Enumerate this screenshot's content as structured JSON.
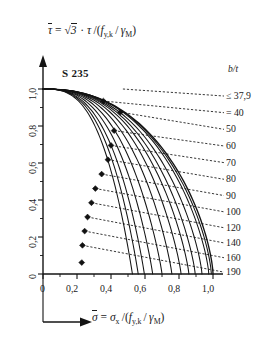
{
  "figure": {
    "steel_grade": "S 235",
    "bt_header": "b/t",
    "y_axis_equation_parts": {
      "tau_bar": "τ",
      "equals": "=",
      "sqrt3": "3",
      "dot": "·",
      "tau": "τ",
      "slash_open": "/(",
      "f": "f",
      "f_sub": "y,k",
      "inner_slash": "/",
      "gamma": "γ",
      "gamma_sub": "M",
      "close": ")"
    },
    "x_axis_equation_parts": {
      "sigma_bar": "σ",
      "equals": "=",
      "sigma": "σ",
      "sigma_sub": "x",
      "slash_open": "/(",
      "f": "f",
      "f_sub": "y,k",
      "inner_slash": "/",
      "gamma": "γ",
      "gamma_sub": "M",
      "close": ")"
    }
  },
  "chart_data": {
    "type": "line",
    "title": "",
    "subtitle": "",
    "xlabel": "σ̄ = σx /(fy,k / γM)",
    "ylabel": "τ̄ = √3 · τ /(fy,k / γM)",
    "xlim": [
      0,
      1.0
    ],
    "ylim": [
      0,
      1.0
    ],
    "grid": false,
    "legend_position": "right",
    "x_ticks": [
      0,
      0.2,
      0.4,
      0.6,
      0.8,
      1.0
    ],
    "x_tick_labels": [
      "0",
      "0,2",
      "0,4",
      "0,6",
      "0,8",
      "1,0"
    ],
    "y_ticks": [
      0,
      0.2,
      0.4,
      0.6,
      0.8,
      1.0
    ],
    "y_tick_labels": [
      "0",
      "0,2",
      "0,4",
      "0,6",
      "0,8",
      "1,0"
    ],
    "x_minor_ticks": [
      0.1,
      0.3,
      0.5,
      0.7,
      0.9
    ],
    "y_minor_ticks": [
      0.1,
      0.3,
      0.5,
      0.7,
      0.9
    ],
    "annotation": "S 235",
    "series_label_header": "b/t",
    "series": [
      {
        "name": "≤ 37,9",
        "marker": null,
        "x": [
          0.0,
          0.12,
          0.24,
          0.36,
          0.48,
          0.6,
          0.72,
          0.84,
          0.92,
          0.965,
          0.985,
          1.0
        ],
        "y": [
          1.0,
          0.999,
          0.995,
          0.988,
          0.975,
          0.952,
          0.912,
          0.836,
          0.735,
          0.62,
          0.45,
          0.0
        ]
      },
      {
        "name": "= 40",
        "marker": {
          "x": 0.355,
          "y": 0.935
        },
        "x": [
          0.0,
          0.12,
          0.24,
          0.355,
          0.48,
          0.6,
          0.72,
          0.84,
          0.91,
          0.95,
          0.975,
          0.99
        ],
        "y": [
          1.0,
          0.995,
          0.978,
          0.935,
          0.952,
          0.928,
          0.888,
          0.812,
          0.712,
          0.6,
          0.43,
          0.0
        ]
      },
      {
        "name": "50",
        "marker": {
          "x": 0.455,
          "y": 0.875
        },
        "x": [
          0.0,
          0.12,
          0.26,
          0.38,
          0.455,
          0.58,
          0.7,
          0.8,
          0.875,
          0.925,
          0.955,
          0.975
        ],
        "y": [
          1.0,
          0.985,
          0.948,
          0.905,
          0.875,
          0.838,
          0.782,
          0.706,
          0.608,
          0.49,
          0.33,
          0.0
        ]
      },
      {
        "name": "60",
        "marker": {
          "x": 0.418,
          "y": 0.775
        },
        "x": [
          0.0,
          0.1,
          0.22,
          0.33,
          0.418,
          0.53,
          0.64,
          0.74,
          0.82,
          0.878,
          0.912,
          0.935
        ],
        "y": [
          1.0,
          0.972,
          0.918,
          0.848,
          0.775,
          0.735,
          0.682,
          0.612,
          0.522,
          0.415,
          0.27,
          0.0
        ]
      },
      {
        "name": "70",
        "marker": {
          "x": 0.4,
          "y": 0.695
        },
        "x": [
          0.0,
          0.1,
          0.21,
          0.31,
          0.4,
          0.5,
          0.6,
          0.69,
          0.77,
          0.828,
          0.868,
          0.895
        ],
        "y": [
          1.0,
          0.958,
          0.886,
          0.8,
          0.695,
          0.66,
          0.608,
          0.542,
          0.458,
          0.358,
          0.23,
          0.0
        ]
      },
      {
        "name": "80",
        "marker": {
          "x": 0.382,
          "y": 0.618
        },
        "x": [
          0.0,
          0.09,
          0.19,
          0.29,
          0.382,
          0.47,
          0.56,
          0.645,
          0.72,
          0.782,
          0.828,
          0.858
        ],
        "y": [
          1.0,
          0.945,
          0.858,
          0.752,
          0.618,
          0.592,
          0.542,
          0.478,
          0.4,
          0.308,
          0.196,
          0.0
        ]
      },
      {
        "name": "90",
        "marker": {
          "x": 0.345,
          "y": 0.54
        },
        "x": [
          0.0,
          0.085,
          0.175,
          0.262,
          0.345,
          0.43,
          0.515,
          0.595,
          0.668,
          0.73,
          0.778,
          0.812
        ],
        "y": [
          1.0,
          0.93,
          0.825,
          0.7,
          0.54,
          0.528,
          0.48,
          0.418,
          0.346,
          0.262,
          0.166,
          0.0
        ]
      },
      {
        "name": "100",
        "marker": {
          "x": 0.308,
          "y": 0.462
        },
        "x": [
          0.0,
          0.08,
          0.162,
          0.24,
          0.308,
          0.39,
          0.468,
          0.542,
          0.612,
          0.672,
          0.722,
          0.758
        ],
        "y": [
          1.0,
          0.912,
          0.79,
          0.648,
          0.462,
          0.462,
          0.418,
          0.36,
          0.294,
          0.22,
          0.138,
          0.0
        ]
      },
      {
        "name": "120",
        "marker": {
          "x": 0.285,
          "y": 0.385
        },
        "x": [
          0.0,
          0.075,
          0.15,
          0.222,
          0.285,
          0.355,
          0.425,
          0.492,
          0.556,
          0.614,
          0.664,
          0.7
        ],
        "y": [
          1.0,
          0.892,
          0.752,
          0.592,
          0.385,
          0.39,
          0.35,
          0.3,
          0.242,
          0.18,
          0.112,
          0.0
        ]
      },
      {
        "name": "140",
        "marker": {
          "x": 0.262,
          "y": 0.308
        },
        "x": [
          0.0,
          0.068,
          0.138,
          0.204,
          0.262,
          0.325,
          0.388,
          0.448,
          0.506,
          0.56,
          0.608,
          0.645
        ],
        "y": [
          1.0,
          0.87,
          0.712,
          0.534,
          0.308,
          0.322,
          0.288,
          0.244,
          0.195,
          0.143,
          0.088,
          0.0
        ]
      },
      {
        "name": "160",
        "marker": {
          "x": 0.245,
          "y": 0.232
        },
        "x": [
          0.0,
          0.062,
          0.126,
          0.188,
          0.245,
          0.302,
          0.358,
          0.412,
          0.464,
          0.514,
          0.56,
          0.596
        ],
        "y": [
          1.0,
          0.848,
          0.67,
          0.472,
          0.232,
          0.252,
          0.224,
          0.188,
          0.148,
          0.108,
          0.066,
          0.0
        ]
      },
      {
        "name": "190",
        "marker": {
          "x": 0.232,
          "y": 0.155
        },
        "x": [
          0.0,
          0.056,
          0.114,
          0.172,
          0.232,
          0.285,
          0.336,
          0.386,
          0.434,
          0.48,
          0.524,
          0.56
        ],
        "y": [
          1.0,
          0.822,
          0.622,
          0.398,
          0.155,
          0.178,
          0.156,
          0.13,
          0.101,
          0.072,
          0.043,
          0.0
        ]
      },
      {
        "name": "",
        "marker": {
          "x": 0.228,
          "y": 0.062
        },
        "x": [
          0.0,
          0.052,
          0.106,
          0.16,
          0.228,
          0.268,
          0.316,
          0.362,
          0.408,
          0.45,
          0.492,
          0.526
        ],
        "y": [
          1.0,
          0.8,
          0.58,
          0.33,
          0.062,
          0.11,
          0.094,
          0.077,
          0.058,
          0.04,
          0.022,
          0.0
        ]
      }
    ],
    "leader_labels": [
      {
        "text": "≤ 37,9",
        "y_label": 0.962,
        "from_x": 0.47,
        "from_y": 1.0
      },
      {
        "text": "= 40",
        "y_label": 0.872,
        "from_x": 0.355,
        "from_y": 0.935
      },
      {
        "text": "50",
        "y_label": 0.782,
        "from_x": 0.455,
        "from_y": 0.875
      },
      {
        "text": "60",
        "y_label": 0.692,
        "from_x": 0.418,
        "from_y": 0.775
      },
      {
        "text": "70",
        "y_label": 0.602,
        "from_x": 0.4,
        "from_y": 0.695
      },
      {
        "text": "80",
        "y_label": 0.512,
        "from_x": 0.382,
        "from_y": 0.618
      },
      {
        "text": "90",
        "y_label": 0.424,
        "from_x": 0.345,
        "from_y": 0.54
      },
      {
        "text": "100",
        "y_label": 0.336,
        "from_x": 0.308,
        "from_y": 0.462
      },
      {
        "text": "120",
        "y_label": 0.25,
        "from_x": 0.285,
        "from_y": 0.385
      },
      {
        "text": "140",
        "y_label": 0.168,
        "from_x": 0.262,
        "from_y": 0.308
      },
      {
        "text": "160",
        "y_label": 0.088,
        "from_x": 0.245,
        "from_y": 0.232
      },
      {
        "text": "190",
        "y_label": 0.01,
        "from_x": 0.232,
        "from_y": 0.155
      }
    ]
  }
}
